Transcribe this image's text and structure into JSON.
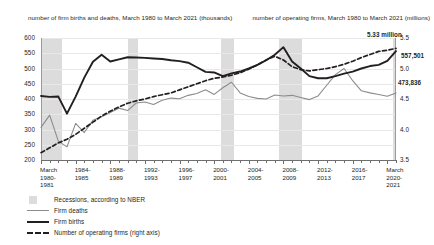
{
  "chart_data": {
    "type": "line",
    "title": "",
    "left_axis": {
      "caption": "number of firm births and deaths,\nMarch 1980 to March 2021 (thousands)",
      "ticks": [
        "600",
        "550",
        "500",
        "450",
        "400",
        "350",
        "300",
        "250",
        "200"
      ],
      "ylim": [
        200,
        600
      ],
      "ylabel": "thousands"
    },
    "right_axis": {
      "caption": "number of operating firms,\nMarch 1980 to March 2021 (millions)",
      "ticks": [
        "5.5",
        "5.0",
        "4.5",
        "4.0",
        "3.5"
      ],
      "ylim": [
        3.5,
        5.5
      ],
      "ylabel": "millions"
    },
    "xlabel": "",
    "x_tick_labels": [
      "March\n1980-\n1981",
      "1984-\n1985",
      "1988-\n1989",
      "1992-\n1993",
      "1996-\n1997",
      "2000-\n2001",
      "2004-\n2005",
      "2008-\n2009",
      "2012-\n2013",
      "2016-\n2017",
      "March\n2020-\n2021"
    ],
    "x_years": [
      1980,
      1981,
      1982,
      1983,
      1984,
      1985,
      1986,
      1987,
      1988,
      1989,
      1990,
      1991,
      1992,
      1993,
      1994,
      1995,
      1996,
      1997,
      1998,
      1999,
      2000,
      2001,
      2002,
      2003,
      2004,
      2005,
      2006,
      2007,
      2008,
      2009,
      2010,
      2011,
      2012,
      2013,
      2014,
      2015,
      2016,
      2017,
      2018,
      2019,
      2020,
      2021
    ],
    "grid": false,
    "legend_position": "below-left",
    "series": [
      {
        "name": "Firm deaths",
        "style": "thin-solid",
        "color": "#8c8c8c",
        "axis": "left",
        "values": [
          307,
          347,
          262,
          243,
          320,
          290,
          330,
          342,
          356,
          370,
          362,
          387,
          390,
          382,
          396,
          403,
          401,
          412,
          418,
          430,
          415,
          437,
          455,
          420,
          408,
          402,
          400,
          413,
          410,
          412,
          405,
          398,
          410,
          445,
          480,
          500,
          460,
          427,
          420,
          415,
          409,
          420
        ]
      },
      {
        "name": "Firm births",
        "style": "thick-solid",
        "color": "#231f20",
        "axis": "left",
        "values": [
          410,
          407,
          408,
          352,
          408,
          470,
          522,
          545,
          523,
          530,
          537,
          536,
          535,
          533,
          531,
          527,
          524,
          519,
          504,
          489,
          487,
          475,
          484,
          490,
          500,
          512,
          527,
          545,
          570,
          523,
          500,
          475,
          468,
          468,
          475,
          483,
          490,
          500,
          508,
          512,
          525,
          557
        ]
      },
      {
        "name": "Number of operating firms (right axis)",
        "style": "dashed",
        "color": "#231f20",
        "axis": "right",
        "values": [
          3.62,
          3.7,
          3.78,
          3.84,
          3.92,
          4.02,
          4.12,
          4.22,
          4.3,
          4.37,
          4.43,
          4.47,
          4.5,
          4.54,
          4.57,
          4.6,
          4.65,
          4.7,
          4.75,
          4.8,
          4.84,
          4.86,
          4.89,
          4.93,
          4.99,
          5.06,
          5.14,
          5.2,
          5.14,
          5.03,
          4.98,
          4.96,
          4.98,
          5.0,
          5.03,
          5.07,
          5.12,
          5.18,
          5.23,
          5.28,
          5.3,
          5.33
        ]
      }
    ],
    "annotations": [
      {
        "name": "operating-firms-peak",
        "text": "5.33\nmillion",
        "value": 5.33
      },
      {
        "name": "firm-births-final",
        "text": "557,501",
        "value": 557501
      },
      {
        "name": "firm-deaths-final",
        "text": "473,836",
        "value": 473836
      }
    ],
    "recessions": [
      {
        "label": "1980-1982 recessions",
        "start": 1980.0,
        "end": 1982.4
      },
      {
        "label": "1990-1991 recession",
        "start": 1990.0,
        "end": 1991.2
      },
      {
        "label": "2001 recession",
        "start": 2000.8,
        "end": 2002.3
      },
      {
        "label": "2007-2009 recession",
        "start": 2007.5,
        "end": 2010.2
      },
      {
        "label": "2020 recession",
        "start": 2020.6,
        "end": 2021.8
      }
    ]
  },
  "legend": {
    "items": [
      {
        "label": "Recessions, according to NBER",
        "mark": "swatch"
      },
      {
        "label": "Firm deaths",
        "mark": "thin-line"
      },
      {
        "label": "Firm births",
        "mark": "thick-line"
      },
      {
        "label": "Number of operating firms (right axis)",
        "mark": "dashed-line"
      }
    ]
  }
}
